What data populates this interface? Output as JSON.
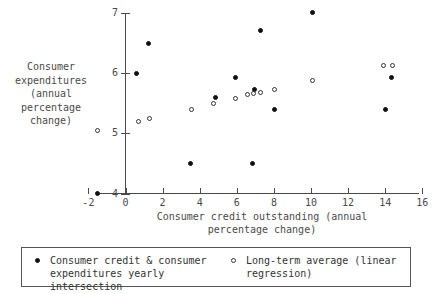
{
  "chart_data": {
    "type": "scatter",
    "title": "",
    "xlabel": "Consumer credit outstanding (annual percentage change)",
    "ylabel": "Consumer expenditures (annual percentage change)",
    "xlim": [
      -2,
      16
    ],
    "ylim": [
      4,
      7
    ],
    "xticks": [
      -2,
      0,
      2,
      4,
      6,
      8,
      10,
      12,
      14,
      16
    ],
    "yticks": [
      4,
      5,
      6,
      7
    ],
    "grid": false,
    "legend_position": "bottom",
    "series": [
      {
        "name": "Consumer credit & consumer expenditures yearly intersection",
        "marker": "filled-circle",
        "color": "#111111",
        "points": [
          [
            -1.5,
            4.0
          ],
          [
            0.6,
            6.0
          ],
          [
            1.25,
            6.5
          ],
          [
            3.5,
            4.5
          ],
          [
            4.85,
            5.6
          ],
          [
            5.95,
            5.92
          ],
          [
            6.85,
            4.5
          ],
          [
            6.95,
            5.72
          ],
          [
            7.3,
            6.7
          ],
          [
            8.05,
            5.4
          ],
          [
            10.1,
            7.0
          ],
          [
            14.0,
            5.4
          ],
          [
            14.35,
            5.92
          ]
        ]
      },
      {
        "name": "Long-term average (linear regression)",
        "marker": "open-circle",
        "color": "#333333",
        "points": [
          [
            -1.5,
            5.05
          ],
          [
            0.7,
            5.2
          ],
          [
            1.3,
            5.25
          ],
          [
            3.55,
            5.4
          ],
          [
            4.75,
            5.5
          ],
          [
            5.95,
            5.58
          ],
          [
            6.6,
            5.65
          ],
          [
            6.9,
            5.66
          ],
          [
            7.3,
            5.67
          ],
          [
            8.05,
            5.72
          ],
          [
            10.1,
            5.87
          ],
          [
            13.9,
            6.12
          ],
          [
            14.4,
            6.13
          ]
        ]
      }
    ]
  },
  "axes": {
    "y_title_lines": [
      "Consumer",
      "expenditures",
      "(annual",
      "percentage",
      "change)"
    ],
    "x_title_lines": [
      "Consumer credit outstanding (annual",
      "percentage change)"
    ],
    "x_tick_labels": [
      "-2",
      "0",
      "2",
      "4",
      "6",
      "8",
      "10",
      "12",
      "14",
      "16"
    ],
    "y_tick_labels": [
      "7",
      "6",
      "5",
      "4"
    ]
  },
  "legend": {
    "entries": [
      {
        "marker": "filled-circle",
        "lines": [
          "Consumer credit & consumer",
          "expenditures yearly intersection"
        ]
      },
      {
        "marker": "open-circle",
        "lines": [
          "Long-term average (linear",
          "regression)"
        ]
      }
    ]
  }
}
